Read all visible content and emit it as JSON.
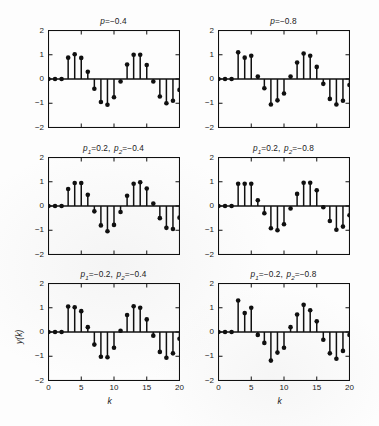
{
  "figure": {
    "kind": "stem-plot-grid",
    "rows": 3,
    "cols": 2,
    "xlabel": "k",
    "ylabel": "y(k)",
    "yticks": [
      "2",
      "1",
      "0",
      "-1",
      "-2"
    ],
    "xticks": [
      "0",
      "5",
      "10",
      "15",
      "20"
    ],
    "line_color": "#101010",
    "marker_color": "#101010",
    "axis_color": "#101010",
    "background": "#ffffff"
  },
  "chart_data": [
    {
      "id": "panel-r1c1",
      "type": "line",
      "subtype": "stem",
      "title": "p=-0.4",
      "title_parts": {
        "sym": "p",
        "text": "=−0.4"
      },
      "xlabel": "k",
      "ylabel": "y(k)",
      "xlim": [
        0,
        20
      ],
      "ylim": [
        -2,
        2
      ],
      "xticks": [
        0,
        5,
        10,
        15,
        20
      ],
      "yticks": [
        -2,
        -1,
        0,
        1,
        2
      ],
      "grid": false,
      "legend": "none",
      "x": [
        0,
        1,
        2,
        3,
        4,
        5,
        6,
        7,
        8,
        9,
        10,
        11,
        12,
        13,
        14,
        15,
        16,
        17,
        18,
        19,
        20
      ],
      "values": [
        0,
        0,
        0,
        0.88,
        1.02,
        0.87,
        0.3,
        -0.4,
        -0.95,
        -1.06,
        -0.75,
        -0.1,
        0.6,
        1.0,
        1.0,
        0.58,
        -0.1,
        -0.72,
        -1.0,
        -0.9,
        -0.45,
        0.3
      ]
    },
    {
      "id": "panel-r1c2",
      "type": "line",
      "subtype": "stem",
      "title": "p=-0.8",
      "title_parts": {
        "sym": "p",
        "text": "=−0.8"
      },
      "xlabel": "k",
      "ylabel": "y(k)",
      "xlim": [
        0,
        20
      ],
      "ylim": [
        -2,
        2
      ],
      "xticks": [
        0,
        5,
        10,
        15,
        20
      ],
      "yticks": [
        -2,
        -1,
        0,
        1,
        2
      ],
      "grid": false,
      "legend": "none",
      "x": [
        0,
        1,
        2,
        3,
        4,
        5,
        6,
        7,
        8,
        9,
        10,
        11,
        12,
        13,
        14,
        15,
        16,
        17,
        18,
        19,
        20
      ],
      "values": [
        0,
        0,
        0,
        1.1,
        0.88,
        0.96,
        0.1,
        -0.38,
        -1.05,
        -0.88,
        -0.6,
        0.1,
        0.68,
        1.05,
        0.96,
        0.5,
        -0.2,
        -0.82,
        -1.05,
        -0.9,
        -0.25,
        0.42
      ]
    },
    {
      "id": "panel-r2c1",
      "type": "line",
      "subtype": "stem",
      "title": "p1=0.2, p2=-0.4",
      "title_parts": {
        "sym1": "p",
        "sub1": "1",
        "mid": "=0.2,",
        "sym2": "p",
        "sub2": "2",
        "tail": "=−0.4"
      },
      "xlabel": "k",
      "ylabel": "y(k)",
      "xlim": [
        0,
        20
      ],
      "ylim": [
        -2,
        2
      ],
      "xticks": [
        0,
        5,
        10,
        15,
        20
      ],
      "yticks": [
        -2,
        -1,
        0,
        1,
        2
      ],
      "grid": false,
      "legend": "none",
      "x": [
        0,
        1,
        2,
        3,
        4,
        5,
        6,
        7,
        8,
        9,
        10,
        11,
        12,
        13,
        14,
        15,
        16,
        17,
        18,
        19,
        20
      ],
      "values": [
        0,
        0,
        0,
        0.7,
        0.95,
        0.95,
        0.46,
        -0.22,
        -0.8,
        -1.04,
        -0.78,
        -0.25,
        0.42,
        0.92,
        0.98,
        0.72,
        0.1,
        -0.5,
        -0.9,
        -0.95,
        -0.48
      ]
    },
    {
      "id": "panel-r2c2",
      "type": "line",
      "subtype": "stem",
      "title": "p1=0.2, p2=-0.8",
      "title_parts": {
        "sym1": "p",
        "sub1": "1",
        "mid": "=0.2,",
        "sym2": "p",
        "sub2": "2",
        "tail": "=−0.8"
      },
      "xlabel": "k",
      "ylabel": "y(k)",
      "xlim": [
        0,
        20
      ],
      "ylim": [
        -2,
        2
      ],
      "xticks": [
        0,
        5,
        10,
        15,
        20
      ],
      "yticks": [
        -2,
        -1,
        0,
        1,
        2
      ],
      "grid": false,
      "legend": "none",
      "x": [
        0,
        1,
        2,
        3,
        4,
        5,
        6,
        7,
        8,
        9,
        10,
        11,
        12,
        13,
        14,
        15,
        16,
        17,
        18,
        19,
        20
      ],
      "values": [
        0,
        0,
        0,
        0.92,
        0.92,
        0.92,
        0.24,
        -0.3,
        -0.92,
        -1.0,
        -0.75,
        -0.1,
        0.5,
        0.96,
        0.96,
        0.65,
        -0.05,
        -0.62,
        -0.98,
        -0.85,
        -0.38
      ]
    },
    {
      "id": "panel-r3c1",
      "type": "line",
      "subtype": "stem",
      "title": "p1=-0.2, p2=-0.4",
      "title_parts": {
        "sym1": "p",
        "sub1": "1",
        "mid": "=−0.2,",
        "sym2": "p",
        "sub2": "2",
        "tail": "=−0.4"
      },
      "xlabel": "k",
      "ylabel": "y(k)",
      "xlim": [
        0,
        20
      ],
      "ylim": [
        -2,
        2
      ],
      "xticks": [
        0,
        5,
        10,
        15,
        20
      ],
      "yticks": [
        -2,
        -1,
        0,
        1,
        2
      ],
      "grid": false,
      "legend": "none",
      "x": [
        0,
        1,
        2,
        3,
        4,
        5,
        6,
        7,
        8,
        9,
        10,
        11,
        12,
        13,
        14,
        15,
        16,
        17,
        18,
        19,
        20
      ],
      "values": [
        0,
        0,
        0,
        1.05,
        1.02,
        0.86,
        0.2,
        -0.52,
        -1.02,
        -1.04,
        -0.65,
        0.05,
        0.7,
        1.06,
        1.0,
        0.52,
        -0.15,
        -0.82,
        -1.06,
        -0.88,
        -0.28
      ]
    },
    {
      "id": "panel-r3c2",
      "type": "line",
      "subtype": "stem",
      "title": "p1=-0.2, p2=-0.8",
      "title_parts": {
        "sym1": "p",
        "sub1": "1",
        "mid": "=−0.2,",
        "sym2": "p",
        "sub2": "2",
        "tail": "=−0.8"
      },
      "xlabel": "k",
      "ylabel": "y(k)",
      "xlim": [
        0,
        20
      ],
      "ylim": [
        -2,
        2
      ],
      "xticks": [
        0,
        5,
        10,
        15,
        20
      ],
      "yticks": [
        -2,
        -1,
        0,
        1,
        2
      ],
      "grid": false,
      "legend": "none",
      "x": [
        0,
        1,
        2,
        3,
        4,
        5,
        6,
        7,
        8,
        9,
        10,
        11,
        12,
        13,
        14,
        15,
        16,
        17,
        18,
        19,
        20
      ],
      "values": [
        0,
        0,
        0,
        1.3,
        0.78,
        1.0,
        -0.12,
        -0.45,
        -1.18,
        -0.85,
        -0.65,
        0.2,
        0.72,
        1.12,
        0.9,
        0.44,
        -0.32,
        -0.88,
        -1.1,
        -0.78,
        -0.12
      ]
    }
  ]
}
